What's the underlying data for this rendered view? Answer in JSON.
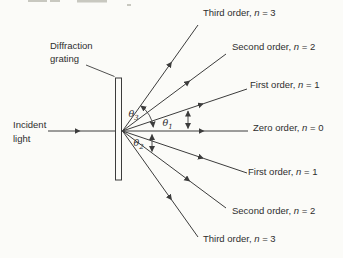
{
  "colors": {
    "background": "#fbfbf8",
    "line": "#3c3c3c",
    "text": "#2e2e2e",
    "artifact": "#c8c8c0"
  },
  "diagram": {
    "grating_label": {
      "line1": "Diffraction",
      "line2": "grating"
    },
    "incident_label": {
      "line1": "Incident",
      "line2": "light"
    },
    "orders": [
      {
        "id": "third-order-up",
        "prefix": "Third order, ",
        "sym": "n",
        "eq": " = 3"
      },
      {
        "id": "second-order-up",
        "prefix": "Second order, ",
        "sym": "n",
        "eq": " = 2"
      },
      {
        "id": "first-order-up",
        "prefix": "First order, ",
        "sym": "n",
        "eq": " = 1"
      },
      {
        "id": "zero-order",
        "prefix": "Zero order, ",
        "sym": "n",
        "eq": " = 0"
      },
      {
        "id": "first-order-down",
        "prefix": "First order, ",
        "sym": "n",
        "eq": " = 1"
      },
      {
        "id": "second-order-down",
        "prefix": "Second order, ",
        "sym": "n",
        "eq": " = 2"
      },
      {
        "id": "third-order-down",
        "prefix": "Third order, ",
        "sym": "n",
        "eq": " = 3"
      }
    ],
    "angles": {
      "theta3": {
        "sym": "θ",
        "sub": "3"
      },
      "theta1": {
        "sym": "θ",
        "sub": "1"
      },
      "theta2": {
        "sym": "θ",
        "sub": "2"
      }
    }
  }
}
